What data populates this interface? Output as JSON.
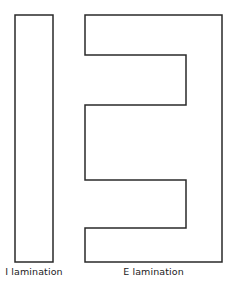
{
  "figure": {
    "background_color": "#ffffff",
    "stroke_color": "#2a2a2a",
    "fill_color": "#ffffff",
    "stroke_width": 1.5
  },
  "shapes": [
    {
      "id": "i-lamination",
      "label": "I lamination",
      "kind": "rectangle",
      "x": 15,
      "y": 15,
      "width": 38,
      "height": 247,
      "points": "15,15 53,15 53,262 15,262"
    },
    {
      "id": "e-lamination",
      "label": "E lamination",
      "kind": "polygon",
      "x": 85,
      "y": 15,
      "width": 137,
      "height": 247,
      "notch_left_x": 186,
      "notch_one_top": 55,
      "notch_one_bottom": 105,
      "notch_two_top": 180,
      "notch_two_bottom": 228,
      "points": "85,15 222,15 222,262 85,262 85,228 186,228 186,180 85,180 85,105 186,105 186,55 85,55"
    }
  ],
  "captions": {
    "i_lamination": "I lamination",
    "e_lamination": "E lamination"
  }
}
